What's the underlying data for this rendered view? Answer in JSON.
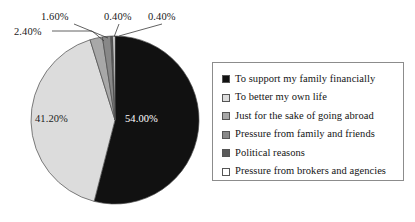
{
  "chart_data": {
    "type": "pie",
    "title": "",
    "subtitle": "",
    "xlabel": "",
    "ylabel": "",
    "legend_position": "right",
    "grid": false,
    "start_angle_deg": 0,
    "direction": "clockwise",
    "categories": [
      "To support my family financially",
      "To better my own life",
      "Just for the sake of going abroad",
      "Pressure from family and friends",
      "Political reasons",
      "Pressure from brokers and agencies"
    ],
    "values": [
      54.0,
      41.2,
      2.4,
      1.6,
      0.4,
      0.4
    ],
    "value_labels": [
      "54.00%",
      "41.20%",
      "2.40%",
      "1.60%",
      "0.40%",
      "0.40%"
    ],
    "colors": [
      "#111111",
      "#dcdcdc",
      "#a8a8a8",
      "#888888",
      "#5a5a5a",
      "#ffffff"
    ],
    "slices": [
      {
        "label": "To support my family financially",
        "value": 54.0,
        "display": "54.00%",
        "color": "#111111",
        "label_placement": "inside",
        "label_color": "#ffffff"
      },
      {
        "label": "To better my own life",
        "value": 41.2,
        "display": "41.20%",
        "color": "#dcdcdc",
        "label_placement": "inside",
        "label_color": "#1c1c1c"
      },
      {
        "label": "Just for the sake of going abroad",
        "value": 2.4,
        "display": "2.40%",
        "color": "#a8a8a8",
        "label_placement": "callout",
        "label_color": "#1a1a1a"
      },
      {
        "label": "Pressure from family and friends",
        "value": 1.6,
        "display": "1.60%",
        "color": "#888888",
        "label_placement": "callout",
        "label_color": "#1a1a1a"
      },
      {
        "label": "Political reasons",
        "value": 0.4,
        "display": "0.40%",
        "color": "#5a5a5a",
        "label_placement": "callout",
        "label_color": "#1a1a1a"
      },
      {
        "label": "Pressure from brokers and agencies",
        "value": 0.4,
        "display": "0.40%",
        "color": "#ffffff",
        "label_placement": "callout",
        "label_color": "#1a1a1a"
      }
    ]
  },
  "pie": {
    "labels": {
      "support_family": "54.00%",
      "better_life": "41.20%",
      "going_abroad": "2.40%",
      "family_pressure": "1.60%",
      "political": "0.40%",
      "brokers": "0.40%"
    }
  },
  "legend": {
    "items": [
      {
        "label": "To support my family financially",
        "color": "#111111"
      },
      {
        "label": "To better my own life",
        "color": "#dcdcdc"
      },
      {
        "label": "Just for the sake of going abroad",
        "color": "#a8a8a8"
      },
      {
        "label": "Pressure from family and friends",
        "color": "#888888"
      },
      {
        "label": "Political reasons",
        "color": "#5a5a5a"
      },
      {
        "label": "Pressure from brokers and agencies",
        "color": "#ffffff"
      }
    ]
  }
}
